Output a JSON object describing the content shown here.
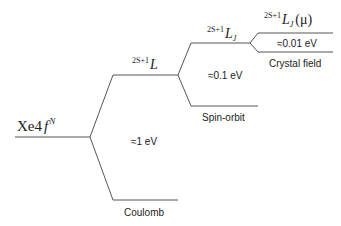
{
  "diagram": {
    "type": "energy-level-splitting",
    "levels": {
      "ground": {
        "label_main": "Xe4",
        "label_f": "f",
        "label_sup": "N"
      },
      "term": {
        "prefix": "2S+1",
        "symbol": "L"
      },
      "multiplet": {
        "prefix": "2S+1",
        "symbol": "L",
        "sub": "J"
      },
      "stark": {
        "prefix": "2S+1",
        "symbol": "L",
        "sub": "J",
        "suffix": "(μ)"
      }
    },
    "splittings": [
      {
        "name": "Coulomb",
        "energy": "≈1 eV"
      },
      {
        "name": "Spin-orbit",
        "energy": "≈0.1 eV"
      },
      {
        "name": "Crystal field",
        "energy": "≈0.01 eV"
      }
    ],
    "line_color": "#555555"
  }
}
